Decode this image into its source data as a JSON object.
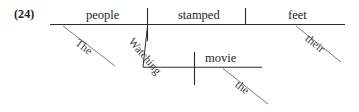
{
  "figure": {
    "example_number": "(24)",
    "type": "reed-kellogg-sentence-diagram",
    "sentence": "The people watching the movie stamped their feet",
    "ink_color": "#2b2b2b",
    "text_color": "#242424",
    "background_color": "#ffffff",
    "main_clause": {
      "subject": "people",
      "verb": "stamped",
      "object": "feet"
    },
    "modifiers": {
      "subject_determiner": "The",
      "participle": "Watching",
      "participle_object": "movie",
      "participle_object_determiner": "the",
      "object_determiner": "their"
    },
    "labels": {
      "subject": "people",
      "verb": "stamped",
      "object": "feet",
      "determiner_the_upper": "The",
      "participle": "Watching",
      "participle_object": "movie",
      "determiner_the_lower": "the",
      "determiner_their": "their"
    }
  }
}
